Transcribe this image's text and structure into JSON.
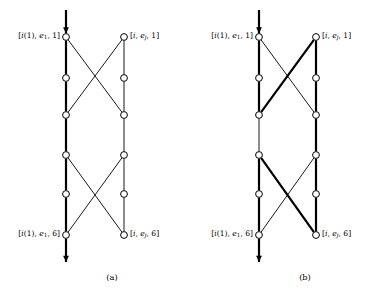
{
  "figure": {
    "type": "trellis-diagram",
    "background_color": "#ffffff",
    "line_color": "#000000",
    "node_fill_color": "#ffffff",
    "width": 385,
    "height": 301
  },
  "panels": [
    {
      "id": "a",
      "caption": "(a)",
      "caption_x": 112,
      "caption_y": 272,
      "left_column_x": 66,
      "right_column_x": 124,
      "labels": {
        "top_left": "[i(1), e_1, 1]",
        "top_right": "[i, e_j, 1]",
        "bottom_left": "[i(1), e_1, 6]",
        "bottom_right": "[i, e_j, 6]"
      }
    },
    {
      "id": "b",
      "caption": "(b)",
      "caption_x": 305,
      "caption_y": 272,
      "left_column_x": 259,
      "right_column_x": 316,
      "labels": {
        "top_left": "[i(1), e_1, 1]",
        "top_right": "[i, e_j, 1]",
        "bottom_left": "[i(1), e_1, 6]",
        "bottom_right": "[i, e_j, 6]"
      }
    }
  ],
  "stage_count": 6,
  "node_rows_y": [
    37,
    78,
    115,
    155,
    194,
    235
  ],
  "arrow": {
    "top_start_y": 10,
    "bottom_end_y": 262
  },
  "line_weights": {
    "thin": 0.9,
    "bold": 2.2
  },
  "node_radius": 3.4,
  "node_stroke_width": 1.0
}
